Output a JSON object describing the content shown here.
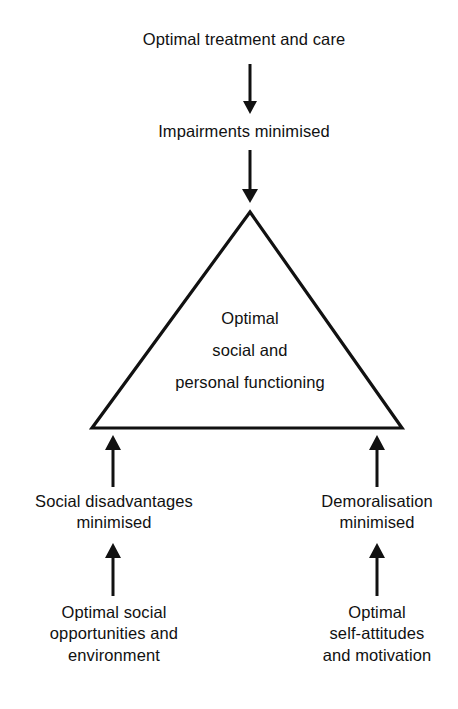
{
  "diagram": {
    "stroke_color": "#111111",
    "background_color": "#ffffff",
    "nodes": {
      "top": "Optimal treatment and care",
      "impairments": "Impairments minimised",
      "core": "Optimal\nsocial and\npersonal functioning",
      "left_middle": "Social disadvantages\nminimised",
      "right_middle": "Demoralisation\nminimised",
      "left_bottom": "Optimal social\nopportunities and\nenvironment",
      "right_bottom": "Optimal\nself-attitudes\nand motivation"
    },
    "shapes": {
      "triangle": {
        "apex_x": 250,
        "apex_y": 212,
        "base_left_x": 92,
        "base_right_x": 402,
        "base_y": 428
      }
    },
    "arrows": [
      {
        "name": "arrow-treatment-to-impairments",
        "direction": "down",
        "x": 250,
        "from_y": 64,
        "to_y": 113
      },
      {
        "name": "arrow-impairments-to-triangle",
        "direction": "down",
        "x": 250,
        "from_y": 150,
        "to_y": 202
      },
      {
        "name": "arrow-social-to-triangle",
        "direction": "up",
        "x": 113,
        "from_y": 487,
        "to_y": 434
      },
      {
        "name": "arrow-demoralisation-to-triangle",
        "direction": "up",
        "x": 377,
        "from_y": 487,
        "to_y": 434
      },
      {
        "name": "arrow-opportunities-to-social",
        "direction": "up",
        "x": 113,
        "from_y": 596,
        "to_y": 542
      },
      {
        "name": "arrow-selfattitudes-to-demoralisation",
        "direction": "up",
        "x": 377,
        "from_y": 596,
        "to_y": 542
      }
    ]
  }
}
